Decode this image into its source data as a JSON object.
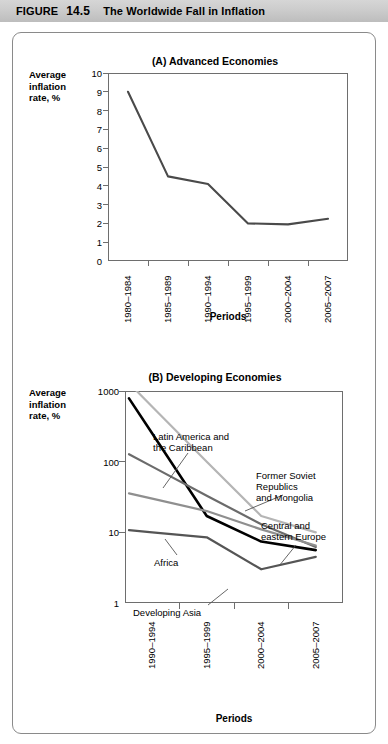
{
  "figure": {
    "label": "FIGURE",
    "number": "14.5",
    "title": "The Worldwide Fall in Inflation"
  },
  "chart_data": [
    {
      "type": "line",
      "panel": "A",
      "title": "(A) Advanced Economies",
      "ylabel": "Average\ninflation\nrate, %",
      "xlabel": "Periods",
      "scale": "linear",
      "ylim": [
        0,
        10
      ],
      "yticks": [
        0,
        1,
        2,
        3,
        4,
        5,
        6,
        7,
        8,
        9,
        10
      ],
      "ytick_labels": [
        "0",
        "1",
        "2",
        "3",
        "4",
        "5",
        "6",
        "7",
        "8",
        "9",
        "10"
      ],
      "categories": [
        "1980–1984",
        "1985–1989",
        "1990–1994",
        "1995–1999",
        "2000–2004",
        "2005–2007"
      ],
      "grid": false,
      "legend": "none",
      "series": [
        {
          "name": "Advanced economies",
          "color": "#4a4a4a",
          "values": [
            9.0,
            4.5,
            4.1,
            2.0,
            1.95,
            2.25
          ]
        }
      ]
    },
    {
      "type": "line",
      "panel": "B",
      "title": "(B) Developing Economies",
      "ylabel": "Average\ninflation\nrate, %",
      "xlabel": "Periods",
      "scale": "log",
      "ylim": [
        1,
        1000
      ],
      "yticks": [
        1,
        10,
        100,
        1000
      ],
      "ytick_labels": [
        "1",
        "10",
        "100",
        "1000"
      ],
      "categories": [
        "1990–1994",
        "1995–1999",
        "2000–2004",
        "2005–2007"
      ],
      "grid": false,
      "legend": "inline-annotations",
      "series": [
        {
          "name": "Latin America and\nthe Caribbean",
          "label": "Latin America and the Caribbean",
          "color": "#b5b5b5",
          "values": [
            600,
            100,
            17,
            10
          ]
        },
        {
          "name": "Former Soviet\nRepublics\nand Mongolia",
          "label": "Former Soviet Republics and Mongolia",
          "color": "#000000",
          "values": [
            250,
            17,
            7.4,
            5.6
          ]
        },
        {
          "name": "Central and\neastern Europe",
          "label": "Central and eastern Europe",
          "color": "#6b6b6b",
          "values": [
            85,
            33,
            13,
            6.2
          ]
        },
        {
          "name": "Africa",
          "label": "Africa",
          "color": "#8f8f8f",
          "values": [
            30,
            20,
            11,
            6.5
          ]
        },
        {
          "name": "Developing Asia",
          "label": "Developing Asia",
          "color": "#555555",
          "values": [
            10,
            8.5,
            3.0,
            4.5
          ]
        }
      ],
      "annotations": [
        {
          "text": "Latin America and\nthe Caribbean",
          "x": 140,
          "y": 398
        },
        {
          "text": "Former Soviet\nRepublics\nand Mongolia",
          "x": 243,
          "y": 437
        },
        {
          "text": "Central and\neastern Europe",
          "x": 248,
          "y": 487
        },
        {
          "text": "Africa",
          "x": 141,
          "y": 524
        },
        {
          "text": "Developing Asia",
          "x": 120,
          "y": 574
        }
      ]
    }
  ]
}
